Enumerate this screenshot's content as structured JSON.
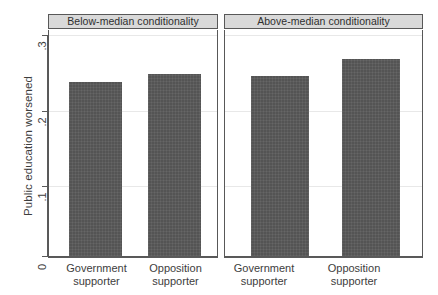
{
  "chart_data": {
    "type": "bar",
    "title": "",
    "xlabel": "",
    "ylabel": "Public education worsened",
    "ylim": [
      0,
      0.3
    ],
    "grid": true,
    "legend": "none",
    "ytick_labels": [
      "0",
      ".1",
      ".2",
      ".3"
    ],
    "ytick_values": [
      0,
      0.1,
      0.2,
      0.3
    ],
    "categories": [
      "Government\nsupporter",
      "Opposition\nsupporter"
    ],
    "panels": [
      {
        "label": "Below-median conditionality",
        "categories": [
          "Government supporter",
          "Opposition supporter"
        ],
        "values": [
          0.236,
          0.247
        ]
      },
      {
        "label": "Above-median conditionality",
        "categories": [
          "Government supporter",
          "Opposition supporter"
        ],
        "values": [
          0.244,
          0.268
        ]
      }
    ],
    "bar_color": "#545454",
    "panel_header_color": "#d9d9d9",
    "axis_color": "#585858",
    "grid_color": "#e8e8e8"
  },
  "axis": {
    "y_label": "Public education worsened",
    "y_ticks": [
      {
        "label": ".3"
      },
      {
        "label": ".2"
      },
      {
        "label": ".1"
      },
      {
        "label": "0"
      }
    ]
  },
  "panel_left": {
    "header": "Below-median conditionality",
    "bars": [
      {
        "label_line1": "Government",
        "label_line2": "supporter",
        "value": 0.236
      },
      {
        "label_line1": "Opposition",
        "label_line2": "supporter",
        "value": 0.247
      }
    ]
  },
  "panel_right": {
    "header": "Above-median conditionality",
    "bars": [
      {
        "label_line1": "Government",
        "label_line2": "supporter",
        "value": 0.244
      },
      {
        "label_line1": "Opposition",
        "label_line2": "supporter",
        "value": 0.268
      }
    ]
  }
}
